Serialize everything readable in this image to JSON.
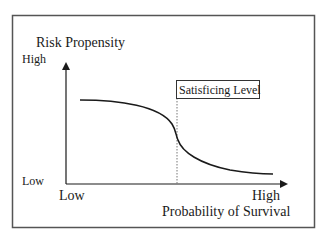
{
  "diagram": {
    "y_axis": {
      "label": "Risk Propensity",
      "high_label": "High",
      "low_label": "Low"
    },
    "x_axis": {
      "label": "Probability of Survival",
      "high_label": "High",
      "low_label": "Low"
    },
    "threshold": {
      "label": "Satisficing Level",
      "line_style": "dotted"
    },
    "curve": {
      "description": "Risk propensity decreasing with probability of survival, sharp drop at satisficing level"
    },
    "colors": {
      "line": "#1a1a1a",
      "frame": "#555555",
      "background": "#ffffff"
    }
  }
}
